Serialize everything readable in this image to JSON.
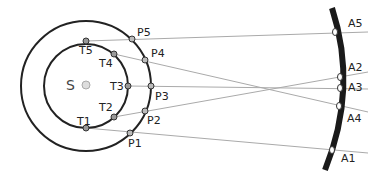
{
  "diagram": {
    "title": "",
    "sun": {
      "label": "S",
      "x": 86,
      "y": 85,
      "r": 4,
      "fill": "#dddddd"
    },
    "inner_orbit": {
      "cx": 86,
      "cy": 86,
      "r": 42
    },
    "outer_orbit": {
      "cx": 86,
      "cy": 86,
      "r": 65
    },
    "inner_points": [
      {
        "label": "T1",
        "x": 86,
        "y": 128
      },
      {
        "label": "T2",
        "x": 114,
        "y": 117
      },
      {
        "label": "T3",
        "x": 128,
        "y": 86
      },
      {
        "label": "T4",
        "x": 114,
        "y": 54
      },
      {
        "label": "T5",
        "x": 86,
        "y": 41
      }
    ],
    "outer_points": [
      {
        "label": "P1",
        "x": 130,
        "y": 133
      },
      {
        "label": "P2",
        "x": 149,
        "y": 111
      },
      {
        "label": "P3",
        "x": 151,
        "y": 86
      },
      {
        "label": "P4",
        "x": 145,
        "y": 60
      },
      {
        "label": "P5",
        "x": 132,
        "y": 39
      }
    ],
    "arc_points": [
      {
        "label": "A1",
        "x": 332,
        "y": 150
      },
      {
        "label": "A2",
        "x": 340,
        "y": 77
      },
      {
        "label": "A3",
        "x": 340,
        "y": 88
      },
      {
        "label": "A4",
        "x": 339,
        "y": 106
      },
      {
        "label": "A5",
        "x": 335,
        "y": 32
      }
    ],
    "colors": {
      "orbit": "#222222",
      "sight_line": "#aaaaaa",
      "point_fill": "#999999",
      "arc": "#1a1a1a"
    }
  }
}
